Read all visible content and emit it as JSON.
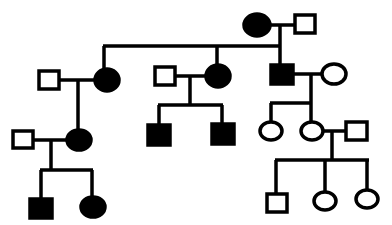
{
  "diagram": {
    "type": "pedigree",
    "stroke_color": "#000000",
    "background": "#ffffff",
    "individuals": [
      {
        "id": "I-1",
        "sex": "female",
        "affected": true
      },
      {
        "id": "I-2",
        "sex": "male",
        "affected": false
      },
      {
        "id": "II-1",
        "sex": "male",
        "affected": false
      },
      {
        "id": "II-2",
        "sex": "female",
        "affected": true
      },
      {
        "id": "II-3",
        "sex": "male",
        "affected": false
      },
      {
        "id": "II-4",
        "sex": "female",
        "affected": true
      },
      {
        "id": "II-5",
        "sex": "male",
        "affected": true
      },
      {
        "id": "II-6",
        "sex": "female",
        "affected": false
      },
      {
        "id": "III-1",
        "sex": "male",
        "affected": false
      },
      {
        "id": "III-2",
        "sex": "female",
        "affected": true
      },
      {
        "id": "III-3",
        "sex": "male",
        "affected": true
      },
      {
        "id": "III-4",
        "sex": "male",
        "affected": true
      },
      {
        "id": "III-5",
        "sex": "female",
        "affected": false
      },
      {
        "id": "III-6",
        "sex": "female",
        "affected": false
      },
      {
        "id": "III-7",
        "sex": "male",
        "affected": false
      },
      {
        "id": "IV-1",
        "sex": "male",
        "affected": true
      },
      {
        "id": "IV-2",
        "sex": "female",
        "affected": true
      },
      {
        "id": "IV-3",
        "sex": "male",
        "affected": false
      },
      {
        "id": "IV-4",
        "sex": "female",
        "affected": false
      },
      {
        "id": "IV-5",
        "sex": "female",
        "affected": false
      }
    ]
  }
}
